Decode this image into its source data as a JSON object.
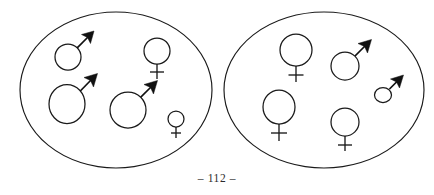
{
  "page": {
    "page_number_text": "– 112 –",
    "background_color": "#ffffff",
    "ink_color": "#1a1a1a",
    "width": 434,
    "height": 195
  },
  "figure": {
    "caption": "",
    "groups": [
      {
        "id": "left-group",
        "label": "",
        "ellipse": {
          "cx": 116,
          "cy": 90,
          "rx": 96,
          "ry": 78
        },
        "symbols": [
          {
            "id": "left-male-small-top",
            "sex": "male",
            "symbol": "♂",
            "cx": 68,
            "cy": 57,
            "r": 13,
            "size": "small"
          },
          {
            "id": "left-female-large-topright",
            "sex": "female",
            "symbol": "♀",
            "cx": 157,
            "cy": 51,
            "r": 13,
            "size": "medium"
          },
          {
            "id": "left-male-large-left",
            "sex": "male",
            "symbol": "♂",
            "cx": 67,
            "cy": 104,
            "r": 19,
            "size": "large"
          },
          {
            "id": "left-male-large-center",
            "sex": "male",
            "symbol": "♂",
            "cx": 128,
            "cy": 110,
            "r": 18,
            "size": "large"
          },
          {
            "id": "left-female-small-bottomright",
            "sex": "female",
            "symbol": "♀",
            "cx": 176,
            "cy": 119,
            "r": 8,
            "size": "small"
          }
        ],
        "counts": {
          "male": 3,
          "female": 2,
          "total": 5
        }
      },
      {
        "id": "right-group",
        "label": "",
        "ellipse": {
          "cx": 324,
          "cy": 90,
          "rx": 100,
          "ry": 78
        },
        "symbols": [
          {
            "id": "right-female-large-top",
            "sex": "female",
            "symbol": "♀",
            "cx": 296,
            "cy": 50,
            "r": 16,
            "size": "large"
          },
          {
            "id": "right-male-medium-top",
            "sex": "male",
            "symbol": "♂",
            "cx": 345,
            "cy": 66,
            "r": 14,
            "size": "medium"
          },
          {
            "id": "right-male-small-right",
            "sex": "male",
            "symbol": "♂",
            "cx": 383,
            "cy": 95,
            "r": 8,
            "size": "small"
          },
          {
            "id": "right-female-large-left",
            "sex": "female",
            "symbol": "♀",
            "cx": 279,
            "cy": 107,
            "r": 17,
            "size": "large"
          },
          {
            "id": "right-female-medium-bottom",
            "sex": "female",
            "symbol": "♀",
            "cx": 345,
            "cy": 122,
            "r": 14,
            "size": "medium"
          }
        ],
        "counts": {
          "male": 2,
          "female": 3,
          "total": 5
        }
      }
    ]
  }
}
